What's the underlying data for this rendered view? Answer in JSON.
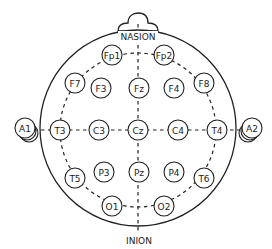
{
  "diagram": {
    "landmarks": {
      "nasion": "NASION",
      "inion": "INION"
    },
    "electrodes": [
      {
        "id": "Fp1",
        "label": "Fp1",
        "x": 112,
        "y": 55
      },
      {
        "id": "Fp2",
        "label": "Fp2",
        "x": 164,
        "y": 55
      },
      {
        "id": "F7",
        "label": "F7",
        "x": 75,
        "y": 83
      },
      {
        "id": "F3",
        "label": "F3",
        "x": 101,
        "y": 88
      },
      {
        "id": "Fz",
        "label": "Fz",
        "x": 139,
        "y": 88
      },
      {
        "id": "F4",
        "label": "F4",
        "x": 174,
        "y": 88
      },
      {
        "id": "F8",
        "label": "F8",
        "x": 204,
        "y": 83
      },
      {
        "id": "T3",
        "label": "T3",
        "x": 60,
        "y": 130
      },
      {
        "id": "C3",
        "label": "C3",
        "x": 99,
        "y": 130
      },
      {
        "id": "Cz",
        "label": "Cz",
        "x": 138,
        "y": 130
      },
      {
        "id": "C4",
        "label": "C4",
        "x": 178,
        "y": 130
      },
      {
        "id": "T4",
        "label": "T4",
        "x": 217,
        "y": 130
      },
      {
        "id": "T5",
        "label": "T5",
        "x": 75,
        "y": 178
      },
      {
        "id": "P3",
        "label": "P3",
        "x": 104,
        "y": 172
      },
      {
        "id": "Pz",
        "label": "Pz",
        "x": 139,
        "y": 172
      },
      {
        "id": "P4",
        "label": "P4",
        "x": 174,
        "y": 172
      },
      {
        "id": "T6",
        "label": "T6",
        "x": 204,
        "y": 178
      },
      {
        "id": "O1",
        "label": "O1",
        "x": 112,
        "y": 206
      },
      {
        "id": "O2",
        "label": "O2",
        "x": 164,
        "y": 206
      },
      {
        "id": "A1",
        "label": "A1",
        "x": 25,
        "y": 128
      },
      {
        "id": "A2",
        "label": "A2",
        "x": 252,
        "y": 128
      }
    ]
  }
}
